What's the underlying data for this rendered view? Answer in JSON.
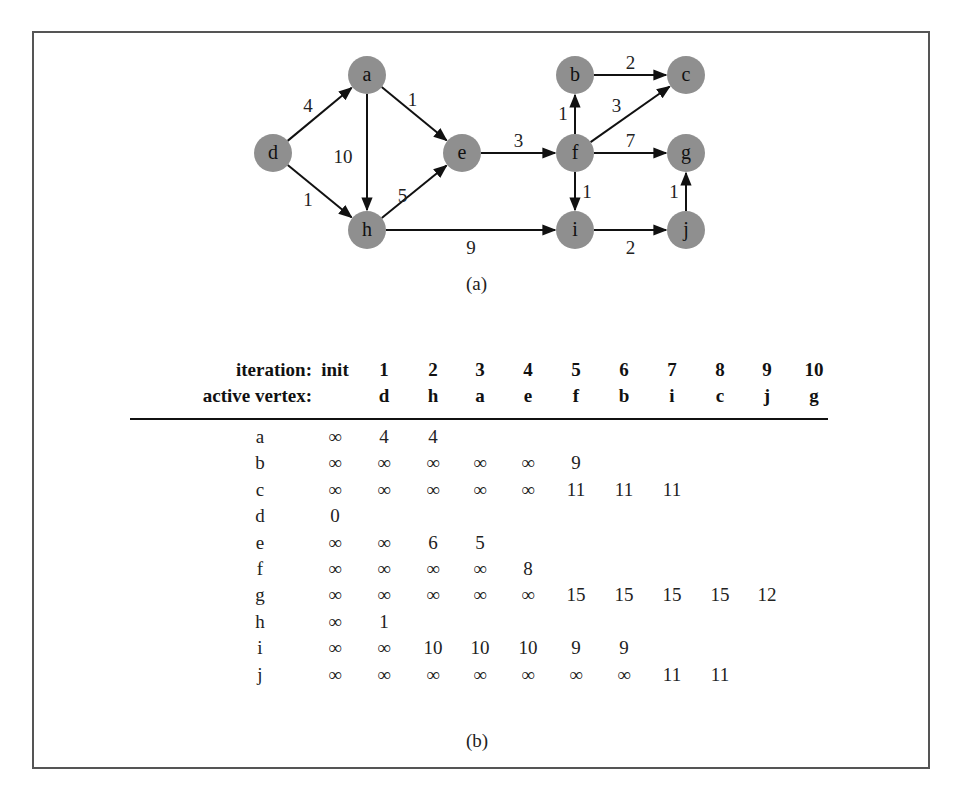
{
  "figure": {
    "caption_a": "(a)",
    "caption_b": "(b)"
  },
  "graph": {
    "node_color": "#8f8f8f",
    "nodes": [
      {
        "id": "a",
        "x": 367,
        "y": 75
      },
      {
        "id": "b",
        "x": 575,
        "y": 75
      },
      {
        "id": "c",
        "x": 686,
        "y": 75
      },
      {
        "id": "d",
        "x": 273,
        "y": 153
      },
      {
        "id": "e",
        "x": 462,
        "y": 153
      },
      {
        "id": "f",
        "x": 575,
        "y": 153
      },
      {
        "id": "g",
        "x": 686,
        "y": 153
      },
      {
        "id": "h",
        "x": 367,
        "y": 230
      },
      {
        "id": "i",
        "x": 575,
        "y": 230
      },
      {
        "id": "j",
        "x": 686,
        "y": 230
      }
    ],
    "edges": [
      {
        "from": "d",
        "to": "a",
        "weight": "4"
      },
      {
        "from": "d",
        "to": "h",
        "weight": "1"
      },
      {
        "from": "a",
        "to": "h",
        "weight": "10"
      },
      {
        "from": "a",
        "to": "e",
        "weight": "1"
      },
      {
        "from": "h",
        "to": "e",
        "weight": "5"
      },
      {
        "from": "e",
        "to": "f",
        "weight": "3"
      },
      {
        "from": "h",
        "to": "i",
        "weight": "9"
      },
      {
        "from": "f",
        "to": "b",
        "weight": "1"
      },
      {
        "from": "b",
        "to": "c",
        "weight": "2"
      },
      {
        "from": "f",
        "to": "c",
        "weight": "3"
      },
      {
        "from": "f",
        "to": "g",
        "weight": "7"
      },
      {
        "from": "f",
        "to": "i",
        "weight": "1"
      },
      {
        "from": "i",
        "to": "j",
        "weight": "2"
      },
      {
        "from": "j",
        "to": "g",
        "weight": "1"
      }
    ]
  },
  "table": {
    "iteration_label": "iteration:",
    "active_vertex_label": "active vertex:",
    "iterations": [
      "init",
      "1",
      "2",
      "3",
      "4",
      "5",
      "6",
      "7",
      "8",
      "9",
      "10"
    ],
    "active_vertices": [
      "",
      "d",
      "h",
      "a",
      "e",
      "f",
      "b",
      "i",
      "c",
      "j",
      "g"
    ],
    "rows": [
      {
        "vertex": "a",
        "values": [
          "∞",
          "4",
          "4",
          "",
          "",
          "",
          "",
          "",
          "",
          "",
          ""
        ]
      },
      {
        "vertex": "b",
        "values": [
          "∞",
          "∞",
          "∞",
          "∞",
          "∞",
          "9",
          "",
          "",
          "",
          "",
          ""
        ]
      },
      {
        "vertex": "c",
        "values": [
          "∞",
          "∞",
          "∞",
          "∞",
          "∞",
          "11",
          "11",
          "11",
          "",
          "",
          ""
        ]
      },
      {
        "vertex": "d",
        "values": [
          "0",
          "",
          "",
          "",
          "",
          "",
          "",
          "",
          "",
          "",
          ""
        ]
      },
      {
        "vertex": "e",
        "values": [
          "∞",
          "∞",
          "6",
          "5",
          "",
          "",
          "",
          "",
          "",
          "",
          ""
        ]
      },
      {
        "vertex": "f",
        "values": [
          "∞",
          "∞",
          "∞",
          "∞",
          "8",
          "",
          "",
          "",
          "",
          "",
          ""
        ]
      },
      {
        "vertex": "g",
        "values": [
          "∞",
          "∞",
          "∞",
          "∞",
          "∞",
          "15",
          "15",
          "15",
          "15",
          "12",
          ""
        ]
      },
      {
        "vertex": "h",
        "values": [
          "∞",
          "1",
          "",
          "",
          "",
          "",
          "",
          "",
          "",
          "",
          ""
        ]
      },
      {
        "vertex": "i",
        "values": [
          "∞",
          "∞",
          "10",
          "10",
          "10",
          "9",
          "9",
          "",
          "",
          "",
          ""
        ]
      },
      {
        "vertex": "j",
        "values": [
          "∞",
          "∞",
          "∞",
          "∞",
          "∞",
          "∞",
          "∞",
          "11",
          "11",
          "",
          ""
        ]
      }
    ]
  }
}
